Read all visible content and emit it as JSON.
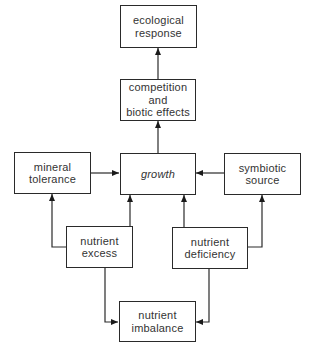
{
  "diagram": {
    "type": "flowchart",
    "nodes": {
      "ecological_response": {
        "lines": [
          "ecological",
          "response"
        ]
      },
      "competition": {
        "lines": [
          "competition",
          "and",
          "biotic effects"
        ]
      },
      "mineral_tolerance": {
        "lines": [
          "mineral",
          "tolerance"
        ]
      },
      "growth": {
        "lines": [
          "growth"
        ]
      },
      "symbiotic_source": {
        "lines": [
          "symbiotic",
          "source"
        ]
      },
      "nutrient_excess": {
        "lines": [
          "nutrient",
          "excess"
        ]
      },
      "nutrient_deficiency": {
        "lines": [
          "nutrient",
          "deficiency"
        ]
      },
      "nutrient_imbalance": {
        "lines": [
          "nutrient",
          "imbalance"
        ]
      }
    },
    "edges": [
      {
        "from": "competition",
        "to": "ecological_response",
        "direction": "forward"
      },
      {
        "from": "growth",
        "to": "competition",
        "direction": "forward"
      },
      {
        "from": "mineral_tolerance",
        "to": "growth",
        "direction": "forward"
      },
      {
        "from": "symbiotic_source",
        "to": "growth",
        "direction": "forward"
      },
      {
        "from": "nutrient_excess",
        "to": "mineral_tolerance",
        "direction": "forward"
      },
      {
        "from": "nutrient_excess",
        "to": "growth",
        "direction": "forward"
      },
      {
        "from": "nutrient_deficiency",
        "to": "growth",
        "direction": "forward"
      },
      {
        "from": "nutrient_deficiency",
        "to": "symbiotic_source",
        "direction": "forward"
      },
      {
        "from": "nutrient_imbalance",
        "to": "nutrient_excess",
        "direction": "bidirectional"
      },
      {
        "from": "nutrient_imbalance",
        "to": "nutrient_deficiency",
        "direction": "bidirectional"
      }
    ]
  }
}
